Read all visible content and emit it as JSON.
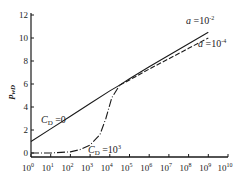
{
  "chart_data": {
    "type": "line",
    "title": "",
    "xlabel": "",
    "ylabel": "p_wD",
    "xscale": "log",
    "xlim": [
      1,
      10000000000
    ],
    "ylim": [
      0,
      12
    ],
    "x_ticks": [
      "10^0",
      "10^1",
      "10^2",
      "10^3",
      "10^4",
      "10^5",
      "10^6",
      "10^7",
      "10^8",
      "10^9",
      "10^10"
    ],
    "y_ticks": [
      0,
      2,
      4,
      6,
      8,
      10,
      12
    ],
    "grid": false,
    "series": [
      {
        "name": "C_D=0",
        "style": "solid",
        "x_log10": [
          0,
          1,
          2,
          3,
          4,
          4.5
        ],
        "y": [
          1.0,
          2.1,
          3.2,
          4.3,
          5.4,
          5.9
        ]
      },
      {
        "name": "C_D=10^3",
        "style": "dash-dot",
        "x_log10": [
          0,
          1,
          2,
          2.5,
          3,
          3.5,
          3.8,
          4.1,
          4.5
        ],
        "y": [
          0,
          0,
          0.1,
          0.3,
          0.7,
          1.6,
          3.0,
          4.8,
          5.9
        ]
      },
      {
        "name": "a=10^-2",
        "style": "solid",
        "x_log10": [
          4.5,
          5,
          6,
          7,
          8,
          9
        ],
        "y": [
          5.9,
          6.45,
          7.5,
          8.5,
          9.5,
          10.5
        ]
      },
      {
        "name": "a=10^-4",
        "style": "dashed",
        "x_log10": [
          4.5,
          5,
          6,
          7,
          8,
          9
        ],
        "y": [
          5.9,
          6.35,
          7.3,
          8.2,
          9.1,
          10.0
        ]
      }
    ],
    "annotations": [
      {
        "text": "C_D =0",
        "x_log10": 0.8,
        "y": 3.2
      },
      {
        "text": "C_D =10^3",
        "x_log10": 3.2,
        "y": -0.6
      },
      {
        "text": "a =10^-2",
        "x_log10": 8.6,
        "y": 11.4
      },
      {
        "text": "a =10^-4",
        "x_log10": 9.1,
        "y": 9.4
      }
    ]
  },
  "labels": {
    "ylabel": "p",
    "ylabel_sub": "wD",
    "cd0": "C",
    "cd0_sub": "D",
    "cd0_val": " =0",
    "cd3": "C",
    "cd3_sub": "D",
    "cd3_val": " =10",
    "cd3_sup": "3",
    "a2": "a",
    "a2_val": " =10",
    "a2_sup": "-2",
    "a4": "a",
    "a4_val": " =10",
    "a4_sup": "-4",
    "x_base": "10",
    "x_exps": [
      "0",
      "1",
      "2",
      "3",
      "4",
      "5",
      "6",
      "7",
      "8",
      "9",
      "10"
    ],
    "y_ticks": [
      "0",
      "2",
      "4",
      "6",
      "8",
      "10",
      "12"
    ]
  }
}
